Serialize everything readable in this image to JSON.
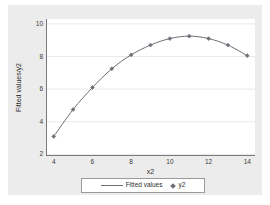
{
  "chart_data": {
    "type": "line",
    "title": "",
    "subtitle": "",
    "xlabel": "x2",
    "ylabel": "Fitted values/y2",
    "x": [
      4,
      5,
      6,
      7,
      8,
      9,
      10,
      11,
      12,
      13,
      14
    ],
    "xlim": [
      3.6,
      14.4
    ],
    "ylim": [
      1.9,
      10.3
    ],
    "xticks": [
      "4",
      "6",
      "8",
      "10",
      "12",
      "14"
    ],
    "xtick_values": [
      4,
      6,
      8,
      10,
      12,
      14
    ],
    "yticks": [
      "2",
      "4",
      "6",
      "8",
      "10"
    ],
    "ytick_values": [
      2,
      4,
      6,
      8,
      10
    ],
    "grid": "horizontal",
    "legend_position": "bottom",
    "series": [
      {
        "name": "Fitted values",
        "marker": "none",
        "style": "line",
        "color": "#6d6f76",
        "values": [
          3.1,
          4.75,
          6.1,
          7.25,
          8.1,
          8.7,
          9.1,
          9.25,
          9.1,
          8.7,
          8.05
        ]
      },
      {
        "name": "y2",
        "marker": "diamond",
        "style": "scatter",
        "color": "#6d6f76",
        "values": [
          3.1,
          4.75,
          6.1,
          7.25,
          8.1,
          8.7,
          9.1,
          9.25,
          9.1,
          8.7,
          8.05
        ]
      }
    ]
  },
  "legend": {
    "fitted_label": "Fitted values",
    "y2_label": "y2"
  },
  "colors": {
    "canvas": "#ececec",
    "plot_background": "#ffffff",
    "axis": "#7a7a7a",
    "gridline": "#e9e9ee",
    "series": "#6d6f76",
    "text": "#2f2f2f"
  }
}
